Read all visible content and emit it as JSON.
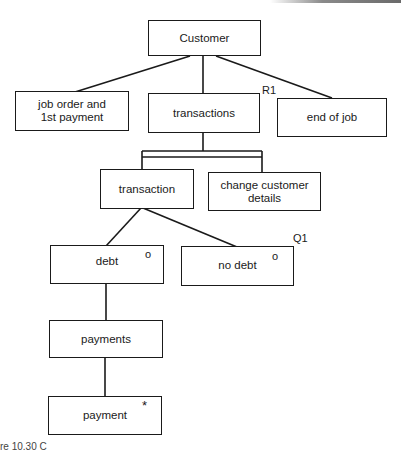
{
  "diagram": {
    "type": "Jackson structure diagram",
    "nodes": [
      {
        "id": "customer",
        "label": "Customer",
        "marker": ""
      },
      {
        "id": "job_order",
        "label": "job order and\n1st payment",
        "marker": ""
      },
      {
        "id": "transactions",
        "label": "transactions",
        "marker": ""
      },
      {
        "id": "end_of_job",
        "label": "end of job",
        "marker": ""
      },
      {
        "id": "transaction",
        "label": "transaction",
        "marker": ""
      },
      {
        "id": "change_details",
        "label": "change customer\ndetails",
        "marker": ""
      },
      {
        "id": "debt",
        "label": "debt",
        "marker": "o"
      },
      {
        "id": "no_debt",
        "label": "no debt",
        "marker": "o"
      },
      {
        "id": "payments",
        "label": "payments",
        "marker": ""
      },
      {
        "id": "payment",
        "label": "payment",
        "marker": "*"
      }
    ],
    "tags": {
      "r1": "R1",
      "q1": "Q1"
    },
    "edges": [
      [
        "customer",
        "job_order"
      ],
      [
        "customer",
        "transactions"
      ],
      [
        "customer",
        "end_of_job"
      ],
      [
        "transactions",
        "transaction"
      ],
      [
        "transactions",
        "change_details"
      ],
      [
        "transaction",
        "debt"
      ],
      [
        "transaction",
        "no_debt"
      ],
      [
        "debt",
        "payments"
      ],
      [
        "payments",
        "payment"
      ]
    ]
  },
  "caption": "re 10.30  C"
}
